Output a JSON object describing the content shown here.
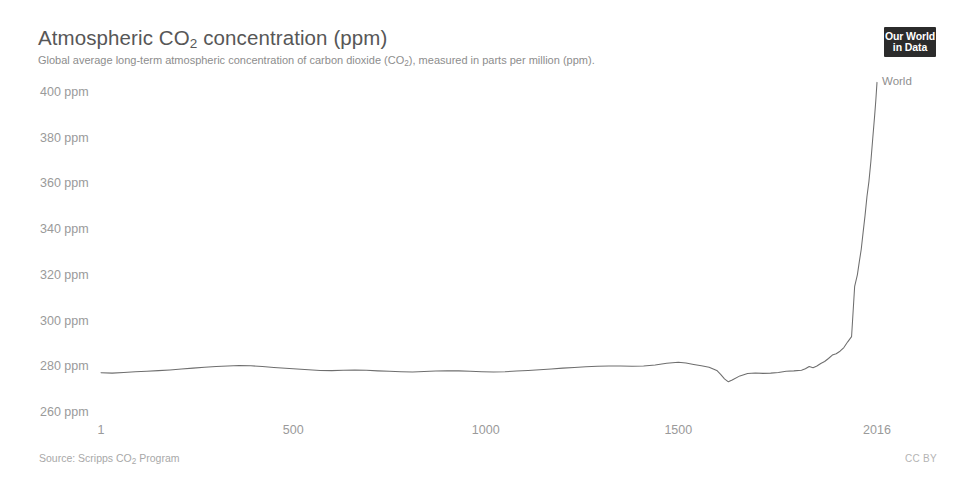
{
  "header": {
    "title_main": "Atmospheric CO",
    "title_sub": "2",
    "title_tail": " concentration (ppm)",
    "subtitle_a": "Global average long-term atmospheric concentration of carbon dioxide (CO",
    "subtitle_sub": "2",
    "subtitle_b": "), measured in parts per million (ppm)."
  },
  "logo": {
    "line1": "Our World",
    "line2": "in Data"
  },
  "footer": {
    "source_a": "Source: Scripps CO",
    "source_sub": "2",
    "source_b": " Program",
    "license": "CC BY"
  },
  "colors": {
    "line": "#6e6e6e",
    "title": "#575757",
    "subtitle": "#8d8d8d",
    "tick": "#9a9a9a",
    "footer": "#a8a8a8",
    "logo_bg": "#2b2b2b",
    "background": "#ffffff"
  },
  "chart_data": {
    "type": "line",
    "title": "Atmospheric CO2 concentration (ppm)",
    "subtitle": "Global average long-term atmospheric concentration of carbon dioxide (CO2), measured in parts per million (ppm).",
    "xlabel": "",
    "ylabel": "",
    "yunit": "ppm",
    "xlim": [
      1,
      2016
    ],
    "ylim": [
      260,
      400
    ],
    "grid": false,
    "legend_position": "end-of-line",
    "xticks": [
      1,
      500,
      1000,
      1500,
      2016
    ],
    "xtick_labels": [
      "1",
      "500",
      "1000",
      "1500",
      "2016"
    ],
    "yticks": [
      260,
      280,
      300,
      320,
      340,
      360,
      380,
      400
    ],
    "ytick_labels": [
      "260 ppm",
      "280 ppm",
      "300 ppm",
      "320 ppm",
      "340 ppm",
      "360 ppm",
      "380 ppm",
      "400 ppm"
    ],
    "series": [
      {
        "name": "World",
        "color": "#6e6e6e",
        "x": [
          1,
          30,
          60,
          90,
          120,
          150,
          180,
          210,
          240,
          270,
          300,
          330,
          360,
          390,
          420,
          450,
          480,
          510,
          540,
          570,
          600,
          630,
          660,
          690,
          720,
          750,
          780,
          810,
          840,
          870,
          900,
          930,
          960,
          990,
          1020,
          1050,
          1080,
          1110,
          1140,
          1170,
          1200,
          1230,
          1260,
          1290,
          1320,
          1350,
          1380,
          1410,
          1440,
          1470,
          1500,
          1520,
          1540,
          1560,
          1580,
          1600,
          1610,
          1620,
          1630,
          1640,
          1660,
          1680,
          1700,
          1720,
          1740,
          1760,
          1780,
          1800,
          1820,
          1830,
          1840,
          1850,
          1860,
          1870,
          1880,
          1890,
          1900,
          1910,
          1920,
          1930,
          1940,
          1950,
          1958,
          1965,
          1970,
          1975,
          1980,
          1985,
          1990,
          1995,
          2000,
          2005,
          2010,
          2013,
          2016
        ],
        "y": [
          277.2,
          277.0,
          277.3,
          277.6,
          277.8,
          278.1,
          278.4,
          278.8,
          279.2,
          279.6,
          279.9,
          280.1,
          280.3,
          280.2,
          279.9,
          279.5,
          279.1,
          278.8,
          278.5,
          278.2,
          278.1,
          278.3,
          278.4,
          278.3,
          278.0,
          277.8,
          277.6,
          277.5,
          277.7,
          277.9,
          278.0,
          278.0,
          277.8,
          277.6,
          277.5,
          277.6,
          277.9,
          278.2,
          278.5,
          278.8,
          279.2,
          279.5,
          279.8,
          280.0,
          280.1,
          280.1,
          280.0,
          280.1,
          280.6,
          281.3,
          281.8,
          281.4,
          280.8,
          280.2,
          279.6,
          278.2,
          276.5,
          274.5,
          273.2,
          274.0,
          275.8,
          276.8,
          277.1,
          276.9,
          277.0,
          277.3,
          277.8,
          278.0,
          278.3,
          278.9,
          279.9,
          279.4,
          280.1,
          281.2,
          282.1,
          283.4,
          284.9,
          285.5,
          286.6,
          288.2,
          290.7,
          293.0,
          315.0,
          320.0,
          325.7,
          331.1,
          338.7,
          346.0,
          354.4,
          360.8,
          369.5,
          379.8,
          389.9,
          396.5,
          404.2
        ]
      }
    ],
    "annotations": [
      {
        "text": "World",
        "x": 2016,
        "y": 404.2
      }
    ]
  },
  "geometry": {
    "plot_left": 101,
    "plot_right": 877,
    "plot_top": 92,
    "plot_bottom": 412
  }
}
